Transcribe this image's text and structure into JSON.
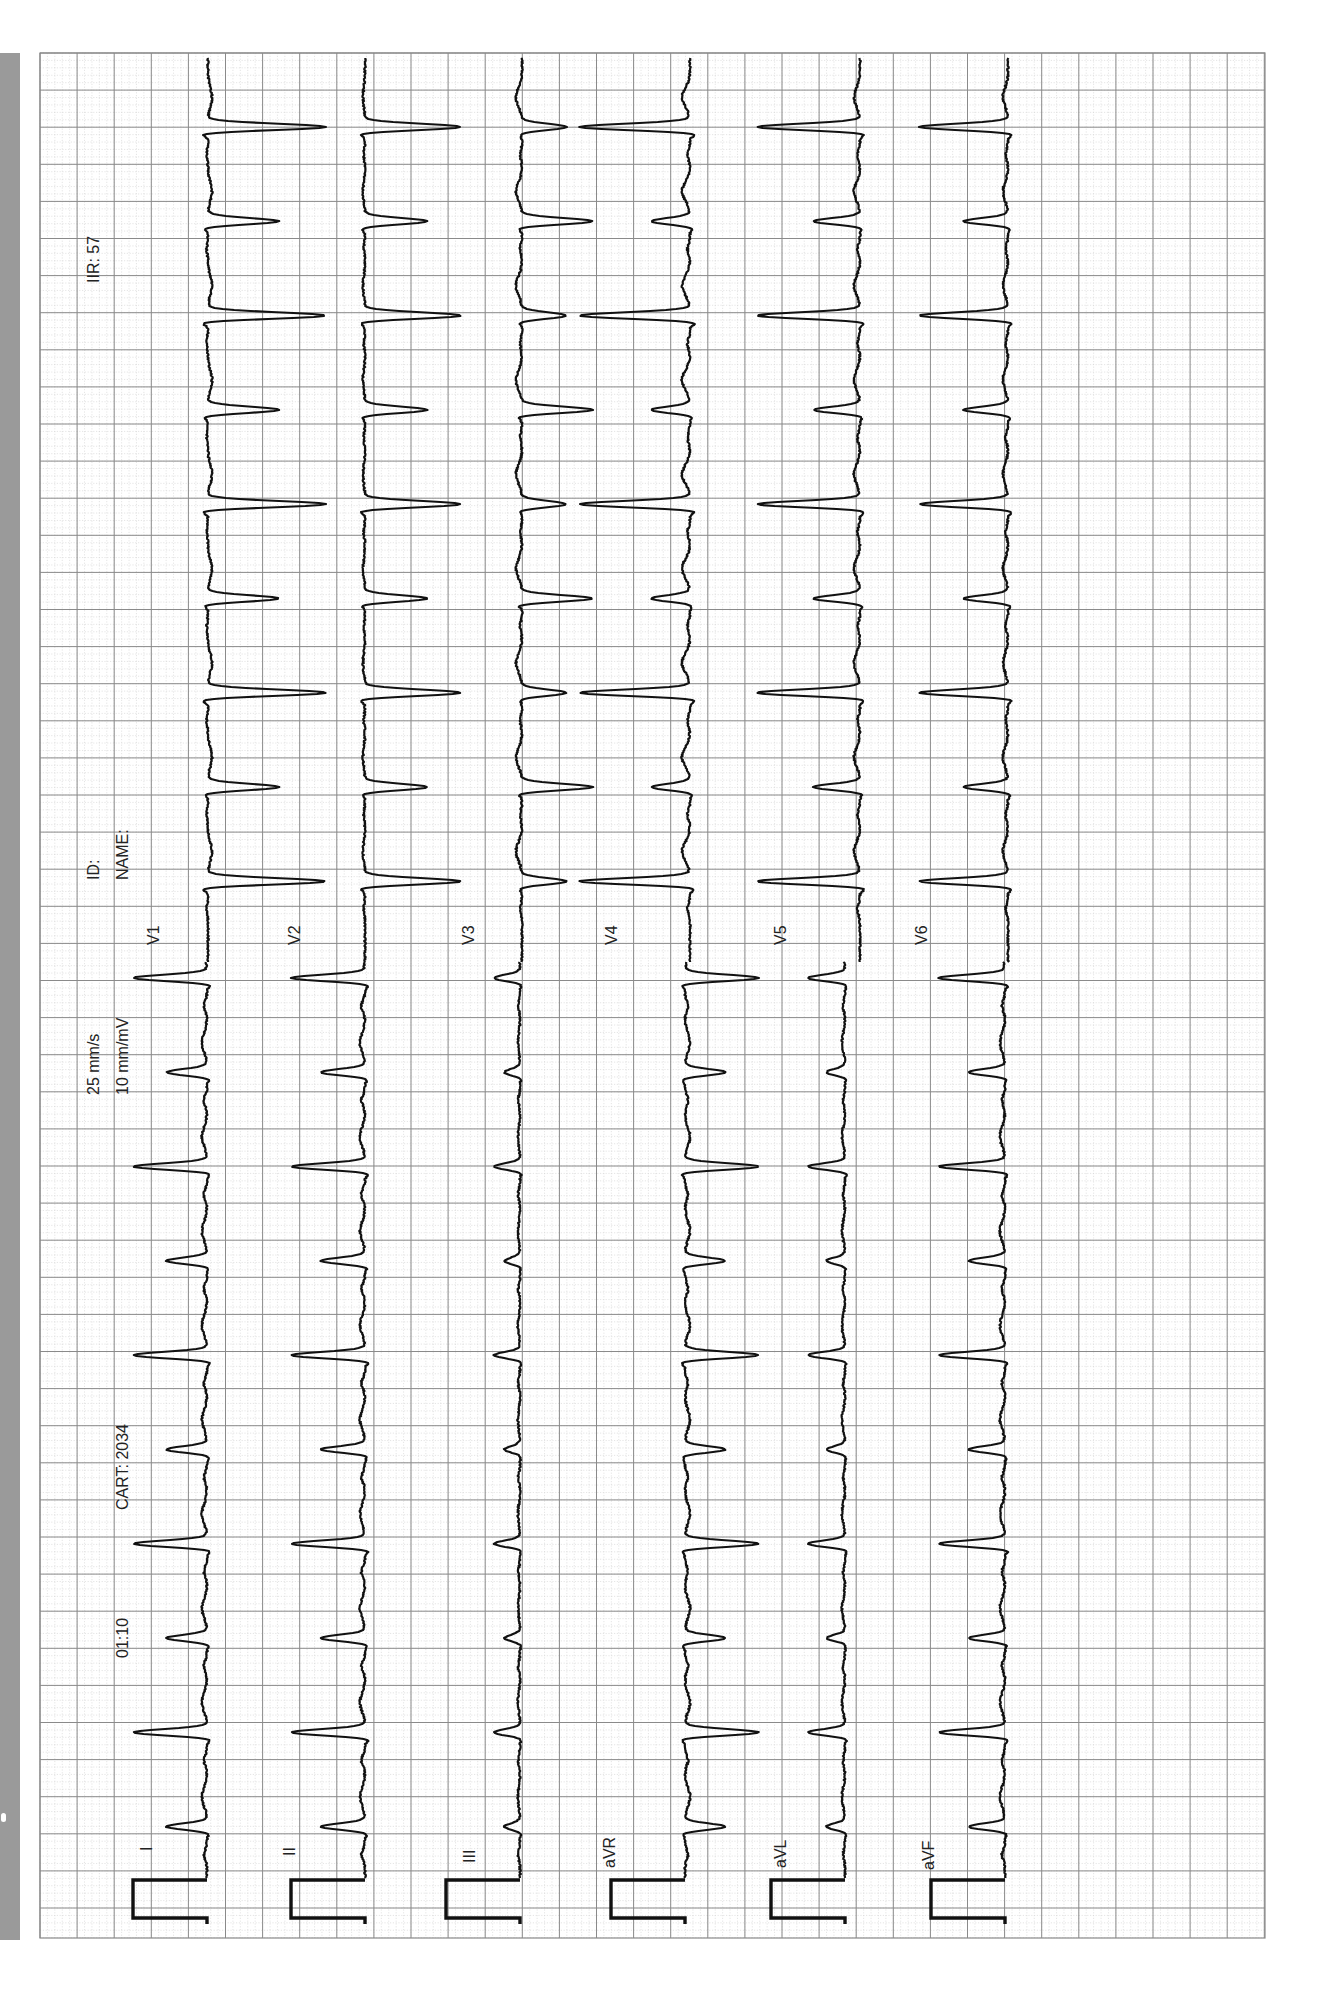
{
  "header": {
    "heart_rate_label": "IIR: 57",
    "id_label": "ID:",
    "name_label": "NAME:",
    "speed": "25 mm/s",
    "gain": "10 mm/mV",
    "cart": "CART: 2034",
    "time": "01:10"
  },
  "colors": {
    "grid_major": "#8a8a8a",
    "grid_minor": "#d4d4d4",
    "trace": "#111111",
    "sidebar": "#9a9a9a"
  },
  "chart_data": {
    "type": "line",
    "paper_speed_mm_s": 25,
    "gain_mm_mV": 10,
    "heart_rate_bpm": 57,
    "grid": true,
    "segments": [
      {
        "name": "limb",
        "leads": [
          "I",
          "II",
          "III",
          "aVR",
          "aVL",
          "aVF"
        ],
        "qrs_polarity": [
          1,
          1,
          0.35,
          -1,
          0.5,
          0.9
        ],
        "alternans": [
          0.55,
          0.6,
          0.6,
          0.55,
          0.5,
          0.55
        ]
      },
      {
        "name": "precordial",
        "leads": [
          "V1",
          "V2",
          "V3",
          "V4",
          "V5",
          "V6"
        ],
        "qrs_polarity": [
          -1.6,
          -1.3,
          -0.6,
          1.5,
          1.4,
          1.2
        ],
        "alternans": [
          0.6,
          0.65,
          1.6,
          0.35,
          0.45,
          0.5
        ]
      }
    ],
    "beat_spacing_px": 94.3,
    "calibration_pulse_mV": 1
  },
  "leads": {
    "limb": [
      "I",
      "II",
      "III",
      "aVR",
      "aVL",
      "aVF"
    ],
    "precordial": [
      "V1",
      "V2",
      "V3",
      "V4",
      "V5",
      "V6"
    ]
  }
}
